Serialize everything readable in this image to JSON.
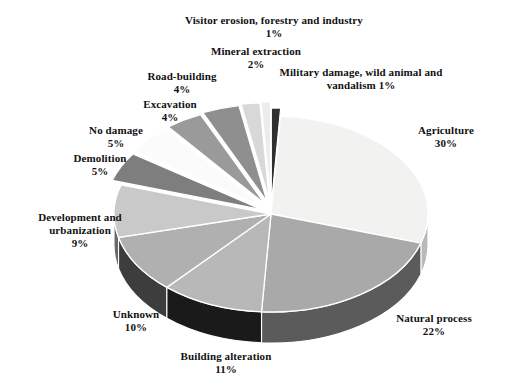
{
  "figure": {
    "title": "",
    "background": "#ffffff"
  },
  "chart_data": {
    "type": "pie",
    "title": "",
    "xlabel": "",
    "ylabel": "",
    "legend_position": "callout-labels",
    "grid": false,
    "units": "percent",
    "total": 100,
    "style": {
      "three_d": true,
      "exploded_slices": true,
      "label_format": "name + newline + value%"
    },
    "categories": [
      "Agriculture",
      "Natural process",
      "Building alteration",
      "Unknown",
      "Development and urbanization",
      "Demolition",
      "No damage",
      "Excavation",
      "Road-building",
      "Mineral extraction",
      "Visitor erosion, forestry and industry",
      "Military damage, wild animal and vandalism"
    ],
    "values": [
      30,
      22,
      11,
      10,
      9,
      5,
      5,
      4,
      4,
      2,
      1,
      1
    ],
    "slice_colors": [
      "#f2f2f0",
      "#a9a9a9",
      "#b8b8b8",
      "#b0b0b0",
      "#c9c9c9",
      "#7e7e7e",
      "#fbfbfb",
      "#9a9a9a",
      "#8f8f8f",
      "#d8d8d8",
      "#ececec",
      "#303030"
    ],
    "slice_side_colors": [
      "#b9b9b9",
      "#5b5b5b",
      "#1a1a1a",
      "#3d3d3d",
      "#6a6a6a",
      "#4a4a4a",
      "#c8c8c8",
      "#5e5e5e",
      "#555555",
      "#8a8a8a",
      "#a0a0a0",
      "#151515"
    ],
    "labels": [
      {
        "name": "Agriculture",
        "value": "30%"
      },
      {
        "name": "Natural process",
        "value": "22%"
      },
      {
        "name": "Building alteration",
        "value": "11%"
      },
      {
        "name": "Unknown",
        "value": "10%"
      },
      {
        "name": "Development and urbanization",
        "value": "9%"
      },
      {
        "name": "Demolition",
        "value": "5%"
      },
      {
        "name": "No damage",
        "value": "5%"
      },
      {
        "name": "Excavation",
        "value": "4%"
      },
      {
        "name": "Road-building",
        "value": "4%"
      },
      {
        "name": "Mineral extraction",
        "value": "2%"
      },
      {
        "name": "Visitor erosion, forestry and industry",
        "value": "1%"
      },
      {
        "name": "Military damage, wild animal and vandalism",
        "value": "1%"
      }
    ]
  },
  "callouts": {
    "visitor": {
      "label": "Visitor erosion, forestry and industry",
      "value": "1%"
    },
    "mineral": {
      "label": "Mineral extraction",
      "value": "2%"
    },
    "military": {
      "label": "Military damage, wild animal and",
      "value": "vandalism 1%"
    },
    "road": {
      "label": "Road-building",
      "value": "4%"
    },
    "excavation": {
      "label": "Excavation",
      "value": "4%"
    },
    "no_damage": {
      "label": "No damage",
      "value": "5%"
    },
    "demolition": {
      "label": "Demolition",
      "value": "5%"
    },
    "development": {
      "label": "Development and urbanization",
      "value": "9%"
    },
    "unknown": {
      "label": "Unknown",
      "value": "10%"
    },
    "building": {
      "label": "Building alteration",
      "value": "11%"
    },
    "natural": {
      "label": "Natural process",
      "value": "22%"
    },
    "agriculture": {
      "label": "Agriculture",
      "value": "30%"
    }
  }
}
